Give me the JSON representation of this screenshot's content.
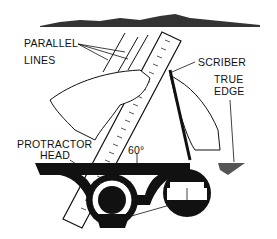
{
  "labels": {
    "parallel_lines": [
      "PARALLEL",
      "LINES"
    ],
    "scriber": "SCRIBER",
    "true_edge": [
      "TRUE",
      "EDGE"
    ],
    "protractor_head": [
      "PROTRACTOR",
      "HEAD"
    ],
    "angle": "60°"
  },
  "colors": {
    "ink": "#111111",
    "background": "#ffffff"
  }
}
